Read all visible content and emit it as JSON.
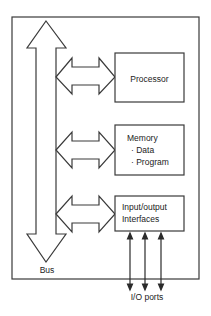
{
  "diagram": {
    "components": [
      {
        "id": "processor",
        "label": "Processor"
      },
      {
        "id": "memory",
        "label": "Memory",
        "items": [
          "· Data",
          "· Program"
        ]
      },
      {
        "id": "io",
        "label_lines": [
          "Input/output",
          "Interfaces"
        ]
      }
    ],
    "bus_label": "Bus",
    "io_ports_label": "I/O ports",
    "colors": {
      "stroke": "#3a3a3a",
      "text": "#222222",
      "background": "#ffffff"
    }
  }
}
